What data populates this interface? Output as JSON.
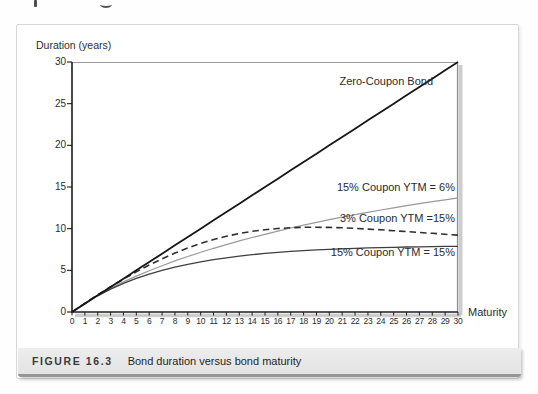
{
  "figure": {
    "label": "FIGURE 16.3",
    "caption": "Bond duration versus bond maturity"
  },
  "chart_data": {
    "type": "line",
    "title": "",
    "xlabel": "Maturity",
    "ylabel": "Duration (years)",
    "xlim": [
      0,
      30
    ],
    "ylim": [
      0,
      30
    ],
    "grid": false,
    "legend_position": "labels-on-plot",
    "x_ticks": [
      0,
      1,
      2,
      3,
      4,
      5,
      6,
      7,
      8,
      9,
      10,
      11,
      12,
      13,
      14,
      15,
      16,
      17,
      18,
      19,
      20,
      21,
      22,
      23,
      24,
      25,
      26,
      27,
      28,
      29,
      30
    ],
    "y_ticks": [
      0,
      5,
      10,
      15,
      20,
      25,
      30
    ],
    "x": [
      0,
      1,
      2,
      3,
      4,
      5,
      6,
      7,
      8,
      9,
      10,
      11,
      12,
      13,
      14,
      15,
      16,
      17,
      18,
      19,
      20,
      21,
      22,
      23,
      24,
      25,
      26,
      27,
      28,
      29,
      30
    ],
    "series": [
      {
        "name": "Zero-Coupon Bond",
        "style": "solid",
        "color": "#161616",
        "width": 1.8,
        "values": [
          0,
          1,
          2,
          3,
          4,
          5,
          6,
          7,
          8,
          9,
          10,
          11,
          12,
          13,
          14,
          15,
          16,
          17,
          18,
          19,
          20,
          21,
          22,
          23,
          24,
          25,
          26,
          27,
          28,
          29,
          30
        ]
      },
      {
        "name": "15% Coupon YTM = 6%",
        "style": "solid",
        "color": "#999999",
        "width": 1.2,
        "values": [
          0,
          1.07,
          2.01,
          2.85,
          3.61,
          4.31,
          4.96,
          5.56,
          6.13,
          6.66,
          7.16,
          7.64,
          8.09,
          8.53,
          8.94,
          9.33,
          9.71,
          10.08,
          10.42,
          10.76,
          11.08,
          11.39,
          11.68,
          11.97,
          12.24,
          12.51,
          12.76,
          13.01,
          13.24,
          13.47,
          13.69
        ]
      },
      {
        "name": "3% Coupon YTM =15%",
        "style": "dashed",
        "color": "#2e2e2e",
        "width": 1.6,
        "values": [
          0,
          1.05,
          2.06,
          3.03,
          3.95,
          4.82,
          5.64,
          6.39,
          7.07,
          7.69,
          8.23,
          8.7,
          9.09,
          9.42,
          9.68,
          9.88,
          10.02,
          10.11,
          10.16,
          10.17,
          10.15,
          10.1,
          10.04,
          9.95,
          9.86,
          9.76,
          9.65,
          9.54,
          9.44,
          9.33,
          9.23
        ]
      },
      {
        "name": "15% Coupon YTM = 15%",
        "style": "solid",
        "color": "#3f3f3f",
        "width": 1.3,
        "values": [
          0,
          1.05,
          1.95,
          2.74,
          3.43,
          4.03,
          4.55,
          5.0,
          5.39,
          5.73,
          6.03,
          6.29,
          6.51,
          6.71,
          6.88,
          7.03,
          7.16,
          7.27,
          7.36,
          7.45,
          7.52,
          7.59,
          7.64,
          7.69,
          7.73,
          7.77,
          7.8,
          7.83,
          7.85,
          7.87,
          7.89
        ]
      }
    ],
    "axis_colors": {
      "axis": "#1c1c1c",
      "box_top": "#9c9c9c",
      "box_right": "#8a8a8a",
      "shadow": "#b8b8b8"
    }
  }
}
